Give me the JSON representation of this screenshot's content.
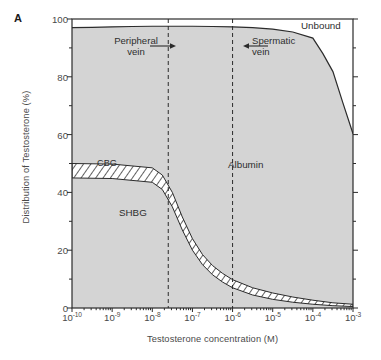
{
  "figure": {
    "panel_label": "A",
    "ylabel": "Distribution of Testosterone (%)",
    "xlabel": "Testosterone concentration (M)"
  },
  "annotations": {
    "peripheral_vein": {
      "line1": "Peripheral",
      "line2": "vein"
    },
    "spermatic_vein": {
      "line1": "Spermatic",
      "line2": "vein"
    }
  },
  "regions": {
    "unbound": "Unbound",
    "albumin": "Albumin",
    "cbg": "CBG",
    "shbg": "SHBG"
  },
  "colors": {
    "fill": "#d4d4d4",
    "stroke": "#2b2b2b",
    "axis": "#2b2b2b",
    "text": "#3a3a3a",
    "hatch": "#3a3a3a"
  },
  "chart_data": {
    "type": "area",
    "title": "",
    "xlabel": "Testosterone concentration (M)",
    "ylabel": "Distribution of Testosterone (%)",
    "xscale": "log",
    "xlim": [
      1e-10,
      0.001
    ],
    "ylim": [
      0,
      100
    ],
    "grid": false,
    "legend": "none",
    "xticks": [
      {
        "label": "10",
        "exponent": "-10",
        "value": 1e-10
      },
      {
        "label": "10",
        "exponent": "-9",
        "value": 1e-09
      },
      {
        "label": "10",
        "exponent": "-8",
        "value": 1e-08
      },
      {
        "label": "10",
        "exponent": "-7",
        "value": 1e-07
      },
      {
        "label": "10",
        "exponent": "-6",
        "value": 1e-06
      },
      {
        "label": "10",
        "exponent": "-5",
        "value": 1e-05
      },
      {
        "label": "10",
        "exponent": "-4",
        "value": 0.0001
      },
      {
        "label": "10",
        "exponent": "-3",
        "value": 0.001
      }
    ],
    "yticks": [
      0,
      20,
      40,
      60,
      80,
      100
    ],
    "stacked_bands": [
      {
        "name": "SHBG",
        "description": "Sex hormone binding globulin bound fraction, lower band from 0% up to lower edge of CBG band",
        "x": [
          1e-10,
          3.16e-10,
          1e-09,
          3.16e-09,
          1e-08,
          1.78e-08,
          3.16e-08,
          5.6e-08,
          1e-07,
          1.78e-07,
          3.16e-07,
          5.6e-07,
          1e-06,
          3.16e-06,
          1e-05,
          3.16e-05,
          0.0001,
          0.000316,
          0.001
        ],
        "values": [
          45,
          45,
          44.8,
          44.5,
          43.5,
          41,
          35,
          27,
          20,
          15,
          11.5,
          9,
          7,
          4.5,
          3,
          2,
          1.3,
          0.8,
          0.5
        ]
      },
      {
        "name": "CBG",
        "description": "Corticosteroid binding globulin bound fraction, hatched band",
        "x": [
          1e-10,
          3.16e-10,
          1e-09,
          3.16e-09,
          1e-08,
          1.78e-08,
          3.16e-08,
          5.6e-08,
          1e-07,
          1.78e-07,
          3.16e-07,
          5.6e-07,
          1e-06,
          3.16e-06,
          1e-05,
          3.16e-05,
          0.0001,
          0.000316,
          0.001
        ],
        "values": [
          5,
          5,
          5,
          5,
          5,
          5,
          5,
          4.5,
          4,
          3.5,
          3.2,
          3,
          2.8,
          2.5,
          2.2,
          1.8,
          1.4,
          1.0,
          0.8
        ]
      },
      {
        "name": "Albumin",
        "description": "Albumin bound fraction, large grey region between CBG upper edge and the unbound boundary",
        "x": [
          1e-10,
          1e-09,
          1e-08,
          1e-07,
          1e-06,
          1e-05,
          0.0001,
          0.000316,
          0.001
        ],
        "values": [
          47,
          47.3,
          48.5,
          73.5,
          87.5,
          92.5,
          94,
          80,
          59
        ]
      },
      {
        "name": "Unbound",
        "description": "Free unbound testosterone, top white region above the upper boundary curve",
        "x": [
          1e-10,
          1e-09,
          1e-08,
          1e-07,
          1e-06,
          1e-05,
          0.0001,
          0.000316,
          0.001
        ],
        "values": [
          3,
          2.7,
          2.5,
          2.5,
          2.7,
          3.5,
          6.6,
          18.2,
          39.7
        ]
      }
    ],
    "boundary_curves": [
      {
        "name": "unbound-boundary",
        "description": "Upper boundary: total bound fraction (top of Albumin region)",
        "x": [
          1e-10,
          3.16e-10,
          1e-09,
          3.16e-09,
          1e-08,
          3.16e-08,
          1e-07,
          3.16e-07,
          1e-06,
          3.16e-06,
          1e-05,
          3.16e-05,
          0.0001,
          0.000178,
          0.000316,
          0.00056,
          0.001
        ],
        "y": [
          97,
          97.1,
          97.3,
          97.4,
          97.5,
          97.5,
          97.5,
          97.4,
          97.3,
          97.0,
          96.5,
          95.5,
          93.4,
          88.0,
          81.8,
          71.0,
          60.3
        ]
      },
      {
        "name": "cbg-upper-edge",
        "description": "Upper edge of the hatched CBG band (top of SHBG+CBG)",
        "x": [
          1e-10,
          1e-09,
          1e-08,
          1.78e-08,
          3.16e-08,
          5.6e-08,
          1e-07,
          1.78e-07,
          3.16e-07,
          5.6e-07,
          1e-06,
          3.16e-06,
          1e-05,
          3.16e-05,
          0.0001,
          0.000316,
          0.001
        ],
        "y": [
          50,
          49.8,
          48.5,
          46,
          40,
          31.5,
          24,
          18.5,
          14.7,
          12,
          9.8,
          7,
          5.2,
          3.8,
          2.7,
          1.8,
          1.3
        ]
      },
      {
        "name": "cbg-lower-edge",
        "description": "Lower edge of the hatched CBG band (top of SHBG region)",
        "x": [
          1e-10,
          1e-09,
          1e-08,
          1.78e-08,
          3.16e-08,
          5.6e-08,
          1e-07,
          1.78e-07,
          3.16e-07,
          5.6e-07,
          1e-06,
          3.16e-06,
          1e-05,
          3.16e-05,
          0.0001,
          0.000316,
          0.001
        ],
        "y": [
          45,
          44.8,
          43.5,
          41,
          35,
          27,
          20,
          15,
          11.5,
          9,
          7,
          4.5,
          3,
          2,
          1.3,
          0.8,
          0.5
        ]
      }
    ],
    "vertical_markers": [
      {
        "name": "peripheral-vein",
        "label": "Peripheral vein",
        "value": 2.5e-08
      },
      {
        "name": "spermatic-vein",
        "label": "Spermatic vein",
        "value": 1e-06
      }
    ]
  }
}
